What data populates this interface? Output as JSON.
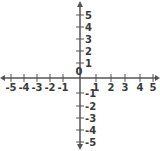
{
  "chart_data": {
    "type": "coordinate-plane",
    "title": "",
    "xlabel": "",
    "ylabel": "",
    "xlim": [
      -5,
      5
    ],
    "ylim": [
      -5,
      5
    ],
    "grid": false,
    "origin_label": "0",
    "x_ticks": [
      -5,
      -4,
      -3,
      -2,
      -1,
      1,
      2,
      3,
      4,
      5
    ],
    "y_ticks": [
      5,
      4,
      3,
      2,
      1,
      -1,
      -2,
      -3,
      -4,
      -5
    ],
    "x_tick_labels": [
      "-5",
      "-4",
      "-3",
      "-2",
      "-1",
      "1",
      "2",
      "3",
      "4",
      "5"
    ],
    "y_tick_labels": [
      "5",
      "4",
      "3",
      "2",
      "1",
      "-1",
      "-2",
      "-3",
      "-4",
      "-5"
    ],
    "arrows": [
      "left",
      "right",
      "up",
      "down"
    ]
  },
  "colors": {
    "axis": "#555555",
    "label": "#3a3a3a",
    "background": "#ffffff"
  },
  "layout": {
    "origin_x": 80,
    "origin_y": 78,
    "x_positions": [
      11,
      24,
      37,
      50,
      63,
      96,
      111,
      125,
      140,
      153
    ],
    "y_positions": [
      15,
      27,
      39,
      51,
      63,
      93,
      106,
      118,
      130,
      142
    ]
  }
}
